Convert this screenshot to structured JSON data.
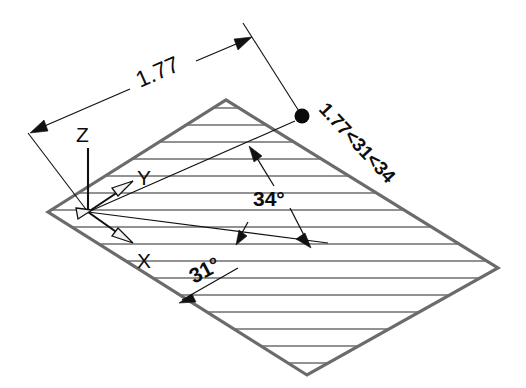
{
  "drawing": {
    "title": "Isometric plane with polar coordinate annotation",
    "background_color": "#ffffff",
    "edge_color": "#6b6b6b",
    "hatch_color": "#6e6e6e",
    "ink_color": "#111111",
    "dimension": {
      "value_label": "1.77",
      "name": "length-dimension"
    },
    "coordinate_callout": {
      "label": "1.77<31<34",
      "name": "polar-coordinate-label"
    },
    "angles": [
      {
        "id": "angle-34",
        "label": "34°"
      },
      {
        "id": "angle-31",
        "label": "31°"
      }
    ],
    "axes": [
      {
        "id": "axis-z",
        "label": "Z"
      },
      {
        "id": "axis-y",
        "label": "Y"
      },
      {
        "id": "axis-x",
        "label": "X"
      }
    ]
  },
  "geometry": {
    "plane_vertices": "48,212 226,100 498,268 307,375",
    "hatch_count": 16
  }
}
